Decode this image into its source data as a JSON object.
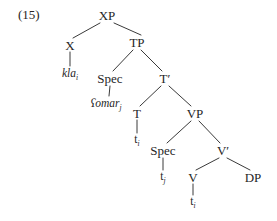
{
  "figure": {
    "example_number": "(15)",
    "type": "x-bar-syntax-tree"
  },
  "nodes": [
    {
      "id": "xp",
      "label": "XP",
      "x": 107,
      "y": 15,
      "style": "plain"
    },
    {
      "id": "x",
      "label": "X",
      "x": 70,
      "y": 45,
      "style": "plain"
    },
    {
      "id": "kla",
      "label": "kla",
      "sub": "i",
      "x": 70,
      "y": 74,
      "style": "italic"
    },
    {
      "id": "tp",
      "label": "TP",
      "x": 137,
      "y": 42,
      "style": "plain"
    },
    {
      "id": "spec_tp",
      "label": "Spec",
      "x": 110,
      "y": 78,
      "style": "plain"
    },
    {
      "id": "omar",
      "label": "ʕomar",
      "sub": "j",
      "x": 106,
      "y": 104,
      "style": "italic"
    },
    {
      "id": "tbar",
      "label": "T′",
      "x": 165,
      "y": 78,
      "style": "plain"
    },
    {
      "id": "t",
      "label": "T",
      "x": 137,
      "y": 113,
      "style": "plain"
    },
    {
      "id": "trace_ti1",
      "label": "t",
      "sub": "i",
      "x": 137,
      "y": 140,
      "style": "trace"
    },
    {
      "id": "vp",
      "label": "VP",
      "x": 195,
      "y": 113,
      "style": "plain"
    },
    {
      "id": "spec_vp",
      "label": "Spec",
      "x": 163,
      "y": 150,
      "style": "plain"
    },
    {
      "id": "trace_tj",
      "label": "t",
      "sub": "j",
      "x": 163,
      "y": 177,
      "style": "trace"
    },
    {
      "id": "vbar",
      "label": "V′",
      "x": 223,
      "y": 150,
      "style": "plain"
    },
    {
      "id": "v",
      "label": "V",
      "x": 193,
      "y": 177,
      "style": "plain"
    },
    {
      "id": "trace_ti2",
      "label": "t",
      "sub": "i",
      "x": 193,
      "y": 202,
      "style": "trace"
    },
    {
      "id": "dp",
      "label": "DP",
      "x": 253,
      "y": 177,
      "style": "plain"
    }
  ],
  "edges": [
    {
      "from": "xp",
      "to": "x",
      "x1": 100,
      "y1": 23,
      "x2": 73,
      "y2": 38
    },
    {
      "from": "xp",
      "to": "tp",
      "x1": 114,
      "y1": 23,
      "x2": 141,
      "y2": 35
    },
    {
      "from": "x",
      "to": "kla",
      "x1": 70,
      "y1": 52,
      "x2": 70,
      "y2": 66
    },
    {
      "from": "tp",
      "to": "spec_tp",
      "x1": 133,
      "y1": 50,
      "x2": 113,
      "y2": 71
    },
    {
      "from": "tp",
      "to": "tbar",
      "x1": 141,
      "y1": 50,
      "x2": 162,
      "y2": 71
    },
    {
      "from": "spec_tp",
      "to": "omar",
      "x1": 110,
      "y1": 86,
      "x2": 109,
      "y2": 96
    },
    {
      "from": "tbar",
      "to": "t",
      "x1": 161,
      "y1": 86,
      "x2": 140,
      "y2": 106
    },
    {
      "from": "tbar",
      "to": "vp",
      "x1": 169,
      "y1": 86,
      "x2": 191,
      "y2": 106
    },
    {
      "from": "t",
      "to": "trace_ti1",
      "x1": 137,
      "y1": 120,
      "x2": 137,
      "y2": 133
    },
    {
      "from": "vp",
      "to": "spec_vp",
      "x1": 191,
      "y1": 121,
      "x2": 167,
      "y2": 143
    },
    {
      "from": "vp",
      "to": "vbar",
      "x1": 199,
      "y1": 121,
      "x2": 220,
      "y2": 143
    },
    {
      "from": "spec_vp",
      "to": "trace_tj",
      "x1": 163,
      "y1": 158,
      "x2": 163,
      "y2": 170
    },
    {
      "from": "vbar",
      "to": "v",
      "x1": 219,
      "y1": 158,
      "x2": 196,
      "y2": 170
    },
    {
      "from": "vbar",
      "to": "dp",
      "x1": 227,
      "y1": 158,
      "x2": 250,
      "y2": 170
    },
    {
      "from": "v",
      "to": "trace_ti2",
      "x1": 193,
      "y1": 184,
      "x2": 193,
      "y2": 195
    }
  ],
  "style": {
    "line_color": "#3a3a3a",
    "text_color": "#262626",
    "background": "#ffffff"
  }
}
